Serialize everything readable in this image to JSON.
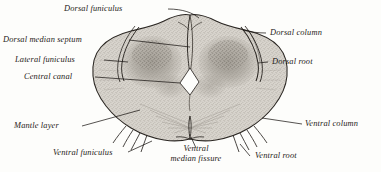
{
  "figure": {
    "style": "engraving",
    "background_color": "#fdfdfb",
    "ink_color": "#1d1a17",
    "tissue_fill": "#cfcbc4",
    "gray_matter_color": "#9a958d"
  },
  "labels": {
    "dorsal_funiculus": "Dorsal funiculus",
    "dorsal_median_septum": "Dorsal median septum",
    "lateral_funiculus": "Lateral funiculus",
    "central_canal": "Central canal",
    "mantle_layer": "Mantle layer",
    "ventral_funiculus": "Ventral funiculus",
    "ventral_median_fissure_line1": "Ventral",
    "ventral_median_fissure_line2": "median fissure",
    "dorsal_column": "Dorsal column",
    "dorsal_root": "Dorsal root",
    "ventral_column": "Ventral column",
    "ventral_root": "Ventral root"
  }
}
